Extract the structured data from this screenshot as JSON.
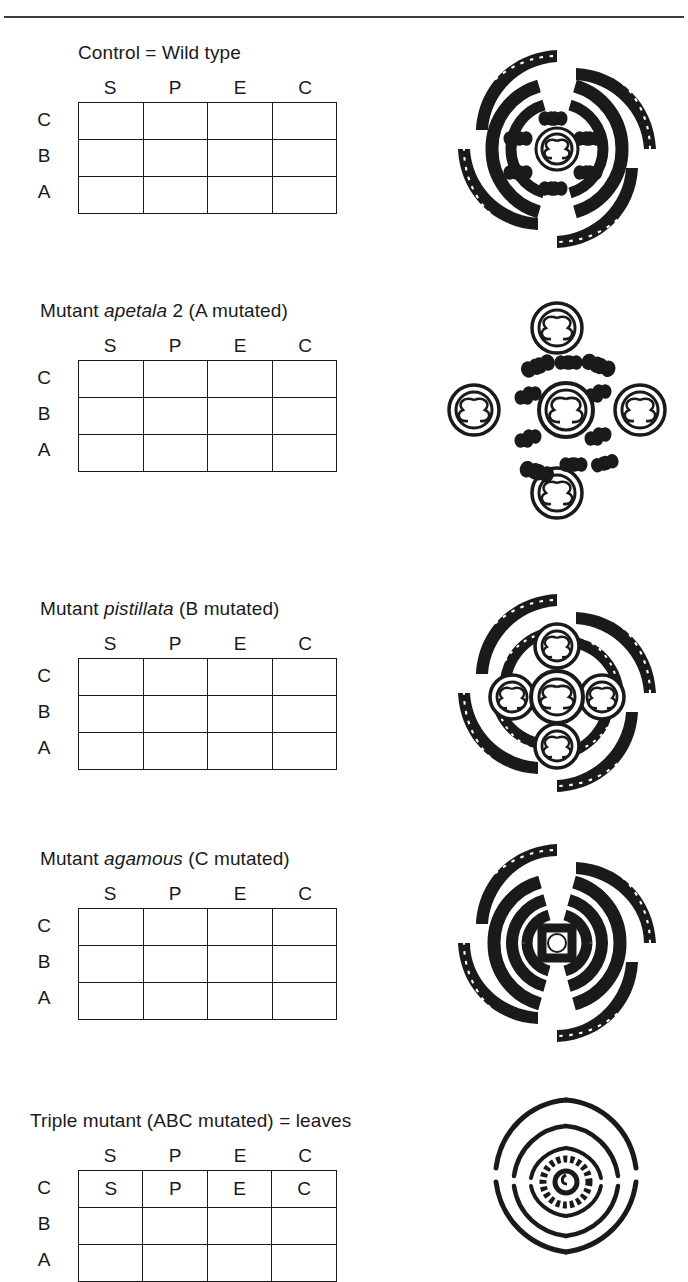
{
  "figure": {
    "columns": [
      "S",
      "P",
      "E",
      "C"
    ],
    "rows": [
      "C",
      "B",
      "A"
    ],
    "column_meaning": {
      "S": "sepal whorl",
      "P": "petal whorl",
      "E": "stamen whorl",
      "C": "carpel whorl"
    }
  },
  "panels": [
    {
      "id": "control",
      "title_parts": [
        {
          "text": "Control = Wild type",
          "italic": false
        }
      ],
      "title_plain": "Control = Wild type",
      "grid": {
        "C": [
          false,
          false,
          true,
          true
        ],
        "B": [
          false,
          true,
          true,
          false
        ],
        "A": [
          true,
          true,
          false,
          false
        ]
      },
      "cell_text": {
        "C": [
          "",
          "",
          "",
          ""
        ],
        "B": [
          "",
          "",
          "",
          ""
        ],
        "A": [
          "",
          "",
          "",
          ""
        ]
      },
      "flower": "wild-type-floral-diagram"
    },
    {
      "id": "apetala2",
      "title_parts": [
        {
          "text": "Mutant ",
          "italic": false
        },
        {
          "text": "apetala",
          "italic": true
        },
        {
          "text": " 2 (A mutated)",
          "italic": false
        }
      ],
      "title_plain": "Mutant apetala 2 (A mutated)",
      "grid": {
        "C": [
          true,
          true,
          true,
          true
        ],
        "B": [
          false,
          true,
          true,
          false
        ],
        "A": [
          false,
          false,
          false,
          false
        ]
      },
      "cell_text": {
        "C": [
          "",
          "",
          "",
          ""
        ],
        "B": [
          "",
          "",
          "",
          ""
        ],
        "A": [
          "",
          "",
          "",
          ""
        ]
      },
      "flower": "apetala2-floral-diagram"
    },
    {
      "id": "pistillata",
      "title_parts": [
        {
          "text": "Mutant ",
          "italic": false
        },
        {
          "text": "pistillata",
          "italic": true
        },
        {
          "text": " (B mutated)",
          "italic": false
        }
      ],
      "title_plain": "Mutant pistillata (B mutated)",
      "grid": {
        "C": [
          false,
          false,
          true,
          true
        ],
        "B": [
          false,
          false,
          false,
          false
        ],
        "A": [
          true,
          true,
          false,
          false
        ]
      },
      "cell_text": {
        "C": [
          "",
          "",
          "",
          ""
        ],
        "B": [
          "",
          "",
          "",
          ""
        ],
        "A": [
          "",
          "",
          "",
          ""
        ]
      },
      "flower": "pistillata-floral-diagram"
    },
    {
      "id": "agamous",
      "title_parts": [
        {
          "text": "Mutant ",
          "italic": false
        },
        {
          "text": "agamous",
          "italic": true
        },
        {
          "text": " (C mutated)",
          "italic": false
        }
      ],
      "title_plain": "Mutant agamous (C mutated)",
      "grid": {
        "C": [
          false,
          false,
          false,
          false
        ],
        "B": [
          false,
          true,
          true,
          false
        ],
        "A": [
          true,
          true,
          true,
          true
        ]
      },
      "cell_text": {
        "C": [
          "",
          "",
          "",
          ""
        ],
        "B": [
          "",
          "",
          "",
          ""
        ],
        "A": [
          "",
          "",
          "",
          ""
        ]
      },
      "flower": "agamous-floral-diagram"
    },
    {
      "id": "triple",
      "title_parts": [
        {
          "text": "Triple mutant (ABC mutated) = leaves",
          "italic": false
        }
      ],
      "title_plain": "Triple mutant (ABC mutated) = leaves",
      "grid": {
        "C": [
          false,
          false,
          false,
          false
        ],
        "B": [
          false,
          false,
          false,
          false
        ],
        "A": [
          false,
          false,
          false,
          false
        ]
      },
      "cell_text": {
        "C": [
          "S",
          "P",
          "E",
          "C"
        ],
        "B": [
          "",
          "",
          "",
          ""
        ],
        "A": [
          "",
          "",
          "",
          ""
        ]
      },
      "flower": "triple-mutant-floral-diagram"
    }
  ],
  "colors": {
    "ink": "#1a1a1a",
    "paper": "#ffffff"
  }
}
